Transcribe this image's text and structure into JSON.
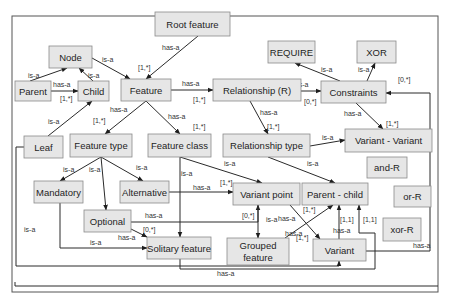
{
  "diagram": {
    "nodes": [
      {
        "id": "root_feature",
        "label": "Root feature"
      },
      {
        "id": "node",
        "label": "Node"
      },
      {
        "id": "parent",
        "label": "Parent"
      },
      {
        "id": "child",
        "label": "Child"
      },
      {
        "id": "feature",
        "label": "Feature"
      },
      {
        "id": "leaf",
        "label": "Leaf"
      },
      {
        "id": "relationship_r",
        "label": "Relationship (R)"
      },
      {
        "id": "require",
        "label": "REQUIRE"
      },
      {
        "id": "xor",
        "label": "XOR"
      },
      {
        "id": "constraints",
        "label": "Constraints"
      },
      {
        "id": "feature_type",
        "label": "Feature type"
      },
      {
        "id": "feature_class",
        "label": "Feature class"
      },
      {
        "id": "relationship_type",
        "label": "Relationship type"
      },
      {
        "id": "variant_variant",
        "label": "Variant - Variant"
      },
      {
        "id": "mandatory",
        "label": "Mandatory"
      },
      {
        "id": "alternative",
        "label": "Alternative"
      },
      {
        "id": "variant_point",
        "label": "Variant point"
      },
      {
        "id": "parent_child",
        "label": "Parent - child"
      },
      {
        "id": "and_r",
        "label": "and-R"
      },
      {
        "id": "or_r",
        "label": "or-R"
      },
      {
        "id": "xor_r",
        "label": "xor-R"
      },
      {
        "id": "optional",
        "label": "Optional"
      },
      {
        "id": "solitary_feature",
        "label": "Solitary feature"
      },
      {
        "id": "grouped_feature",
        "label": "Grouped feature"
      },
      {
        "id": "variant",
        "label": "Variant"
      }
    ],
    "edges": [
      {
        "from": "root_feature",
        "to": "feature",
        "label": "has-a",
        "multiplicity": "[1,*]"
      },
      {
        "from": "parent",
        "to": "node",
        "label": "is-a",
        "multiplicity": ""
      },
      {
        "from": "child",
        "to": "node",
        "label": "is-a",
        "multiplicity": ""
      },
      {
        "from": "node",
        "to": "feature",
        "label": "is-a",
        "multiplicity": ""
      },
      {
        "from": "parent",
        "to": "child",
        "label": "has-a",
        "multiplicity": "[1,*]"
      },
      {
        "from": "leaf",
        "to": "child",
        "label": "is-a",
        "multiplicity": ""
      },
      {
        "from": "feature",
        "to": "relationship_r",
        "label": "has-a",
        "multiplicity": "[1,*]"
      },
      {
        "from": "relationship_r",
        "to": "constraints",
        "label": "has-a",
        "multiplicity": "[0,*]"
      },
      {
        "from": "constraints",
        "to": "require",
        "label": "is-a",
        "multiplicity": ""
      },
      {
        "from": "constraints",
        "to": "xor",
        "label": "is-a",
        "multiplicity": ""
      },
      {
        "from": "feature",
        "to": "feature_type",
        "label": "has-a",
        "multiplicity": "[1,*]"
      },
      {
        "from": "feature",
        "to": "feature_class",
        "label": "has-a",
        "multiplicity": "[1,*]"
      },
      {
        "from": "relationship_r",
        "to": "relationship_type",
        "label": "has-a",
        "multiplicity": "[1,*]"
      },
      {
        "from": "constraints",
        "to": "variant_variant",
        "label": "has-a",
        "multiplicity": "[1,*]"
      },
      {
        "from": "relationship_type",
        "to": "variant_variant",
        "label": "is-a",
        "multiplicity": ""
      },
      {
        "from": "relationship_type",
        "to": "parent_child",
        "label": "is-a",
        "multiplicity": ""
      },
      {
        "from": "feature_type",
        "to": "mandatory",
        "label": "is-a",
        "multiplicity": ""
      },
      {
        "from": "feature_type",
        "to": "optional",
        "label": "is-a",
        "multiplicity": ""
      },
      {
        "from": "feature_type",
        "to": "alternative",
        "label": "is-a",
        "multiplicity": ""
      },
      {
        "from": "feature_class",
        "to": "variant_point",
        "label": "is-a",
        "multiplicity": ""
      },
      {
        "from": "feature_class",
        "to": "solitary_feature",
        "label": "is-a",
        "multiplicity": ""
      },
      {
        "from": "alternative",
        "to": "variant_point",
        "label": "has-a",
        "multiplicity": "[1,*]"
      },
      {
        "from": "optional",
        "to": "variant_point",
        "label": "has-a",
        "multiplicity": "[0,*]"
      },
      {
        "from": "optional",
        "to": "solitary_feature",
        "label": "has-a",
        "multiplicity": "[0,*]"
      },
      {
        "from": "mandatory",
        "to": "solitary_feature",
        "label": "is-a",
        "multiplicity": ""
      },
      {
        "from": "variant_point",
        "to": "grouped_feature",
        "label": "is-a",
        "multiplicity": ""
      },
      {
        "from": "variant_point",
        "to": "variant",
        "label": "has-a",
        "multiplicity": "[1,*]"
      },
      {
        "from": "grouped_feature",
        "to": "parent_child",
        "label": "has-a",
        "multiplicity": "[1,*]"
      },
      {
        "from": "parent_child",
        "to": "and_r",
        "label": "is-a",
        "multiplicity": ""
      },
      {
        "from": "parent_child",
        "to": "or_r",
        "label": "is-a",
        "multiplicity": ""
      },
      {
        "from": "parent_child",
        "to": "xor_r",
        "label": "is-a",
        "multiplicity": ""
      },
      {
        "from": "variant",
        "to": "parent_child",
        "label": "has-a",
        "multiplicity": "[1,1]"
      },
      {
        "from": "solitary_feature",
        "to": "parent_child",
        "label": "has-a",
        "multiplicity": "[1,1]"
      },
      {
        "from": "variant",
        "to": "constraints",
        "label": "has-a",
        "multiplicity": "[0,*]"
      },
      {
        "from": "leaf",
        "to": "variant",
        "label": "is-a",
        "multiplicity": ""
      },
      {
        "from": "solitary_feature",
        "to": "constraints",
        "label": "has-a",
        "multiplicity": ""
      }
    ]
  }
}
